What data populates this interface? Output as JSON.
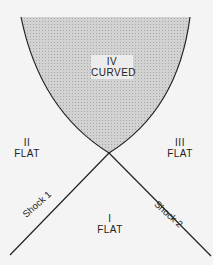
{
  "diagram": {
    "regions": [
      {
        "id": "I",
        "numeral": "I",
        "label": "FLAT"
      },
      {
        "id": "II",
        "numeral": "II",
        "label": "FLAT"
      },
      {
        "id": "III",
        "numeral": "III",
        "label": "FLAT"
      },
      {
        "id": "IV",
        "numeral": "IV",
        "label": "CURVED"
      }
    ],
    "shocks": [
      {
        "label": "Shock 1"
      },
      {
        "label": "Shock 2"
      }
    ],
    "colors": {
      "background": "#f4f4f4",
      "shaded_region": "#c8c8c8",
      "lines": "#222222"
    }
  }
}
